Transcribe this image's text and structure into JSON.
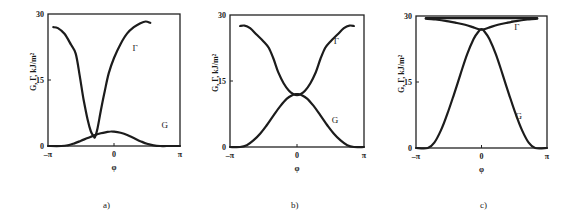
{
  "figure": {
    "panels": [
      "a)",
      "b)",
      "c)"
    ]
  },
  "chart_data": [
    {
      "type": "line",
      "panel": "a)",
      "xlabel": "φ",
      "ylabel": "G, Γ, kJ/m²",
      "xlim": [
        -3.1416,
        3.1416
      ],
      "ylim": [
        0,
        30
      ],
      "xticks": [
        "-π",
        "0",
        "π"
      ],
      "yticks": [
        "0",
        "15",
        "30"
      ],
      "grid": false,
      "frame": {
        "x0": 48,
        "x1": 180,
        "y0": 14,
        "y1": 146
      },
      "series": [
        {
          "name": "Γ",
          "label_pos": [
            0.28,
            21.5
          ],
          "x_over_pi": [
            -0.92,
            -0.85,
            -0.75,
            -0.65,
            -0.58,
            -0.52,
            -0.46,
            -0.4,
            -0.35,
            -0.31,
            -0.29,
            -0.25,
            -0.2,
            -0.14,
            -0.08,
            0.0,
            0.1,
            0.2,
            0.3,
            0.4,
            0.48,
            0.55
          ],
          "values": [
            27.0,
            26.8,
            25.5,
            23.0,
            21.0,
            16.0,
            10.5,
            6.0,
            3.3,
            2.3,
            2.0,
            4.0,
            8.0,
            12.5,
            16.5,
            20.0,
            23.2,
            25.6,
            27.0,
            27.9,
            28.3,
            28.0
          ]
        },
        {
          "name": "G",
          "label_pos": [
            0.72,
            4.0
          ],
          "x_over_pi": [
            -1.0,
            -0.8,
            -0.7,
            -0.6,
            -0.5,
            -0.4,
            -0.3,
            -0.2,
            -0.1,
            -0.05,
            0.0,
            0.1,
            0.2,
            0.3,
            0.4,
            0.5,
            0.6,
            0.7,
            0.8,
            1.0
          ],
          "values": [
            0.0,
            0.0,
            0.15,
            0.6,
            1.2,
            1.8,
            2.4,
            2.9,
            3.2,
            3.3,
            3.25,
            3.0,
            2.5,
            1.8,
            1.1,
            0.5,
            0.15,
            0.0,
            0.0,
            0.0
          ]
        }
      ]
    },
    {
      "type": "line",
      "panel": "b)",
      "xlabel": "φ",
      "ylabel": "G, Γ, kJ/m²",
      "xlim": [
        -3.1416,
        3.1416
      ],
      "ylim": [
        0,
        30
      ],
      "xticks": [
        "-π",
        "0",
        "π"
      ],
      "yticks": [
        "0",
        "15",
        "30"
      ],
      "grid": false,
      "frame": {
        "x0": 230,
        "x1": 364,
        "y0": 15,
        "y1": 147
      },
      "series": [
        {
          "name": "Γ",
          "label_pos": [
            0.55,
            23.5
          ],
          "x_over_pi": [
            -0.85,
            -0.78,
            -0.7,
            -0.6,
            -0.5,
            -0.42,
            -0.35,
            -0.28,
            -0.2,
            -0.12,
            -0.05,
            0.0,
            0.05,
            0.12,
            0.2,
            0.28,
            0.35,
            0.42,
            0.5,
            0.6,
            0.7,
            0.78,
            0.85
          ],
          "values": [
            27.5,
            27.6,
            27.0,
            25.5,
            24.0,
            22.5,
            20.0,
            17.0,
            14.5,
            12.8,
            12.0,
            11.8,
            12.0,
            12.8,
            14.5,
            17.0,
            20.0,
            22.5,
            24.0,
            25.5,
            27.0,
            27.6,
            27.5
          ]
        },
        {
          "name": "G",
          "label_pos": [
            0.52,
            5.5
          ],
          "x_over_pi": [
            -1.0,
            -0.85,
            -0.75,
            -0.65,
            -0.55,
            -0.45,
            -0.35,
            -0.25,
            -0.15,
            -0.05,
            0.0,
            0.05,
            0.15,
            0.25,
            0.35,
            0.45,
            0.55,
            0.65,
            0.75,
            0.85,
            1.0
          ],
          "values": [
            0.0,
            0.0,
            0.4,
            1.5,
            3.0,
            5.0,
            7.2,
            9.3,
            11.0,
            11.9,
            12.0,
            11.9,
            11.0,
            9.3,
            7.2,
            5.0,
            3.0,
            1.5,
            0.4,
            0.0,
            0.0
          ]
        }
      ]
    },
    {
      "type": "line",
      "panel": "c)",
      "xlabel": "φ",
      "ylabel": "G, Γ, kJ/m²",
      "xlim": [
        -3.1416,
        3.1416
      ],
      "ylim": [
        0,
        30
      ],
      "xticks": [
        "-π",
        "0",
        "π"
      ],
      "yticks": [
        "0",
        "15",
        "30"
      ],
      "grid": false,
      "frame": {
        "x0": 416,
        "x1": 547,
        "y0": 16,
        "y1": 148
      },
      "series": [
        {
          "name": "Γ",
          "label_pos": [
            0.5,
            26.8
          ],
          "x_over_pi": [
            -0.85,
            -0.7,
            -0.55,
            -0.4,
            -0.25,
            -0.12,
            -0.04,
            0.0,
            0.04,
            0.12,
            0.25,
            0.4,
            0.55,
            0.7,
            0.85
          ],
          "values": [
            29.4,
            29.2,
            28.9,
            28.5,
            28.0,
            27.4,
            27.0,
            26.9,
            27.0,
            27.4,
            28.0,
            28.5,
            28.9,
            29.2,
            29.4
          ]
        },
        {
          "name": "Γ-upper",
          "x_over_pi": [
            -0.85,
            0.85
          ],
          "values": [
            29.5,
            29.5
          ]
        },
        {
          "name": "G",
          "label_pos": [
            0.52,
            6.5
          ],
          "x_over_pi": [
            -1.0,
            -0.82,
            -0.72,
            -0.62,
            -0.52,
            -0.42,
            -0.32,
            -0.22,
            -0.12,
            -0.04,
            0.0,
            0.04,
            0.12,
            0.22,
            0.32,
            0.42,
            0.52,
            0.62,
            0.72,
            0.82,
            1.0
          ],
          "values": [
            0.0,
            0.0,
            1.2,
            4.0,
            7.8,
            12.2,
            16.8,
            21.3,
            24.8,
            26.6,
            27.0,
            26.6,
            24.8,
            21.3,
            16.8,
            12.2,
            7.8,
            4.0,
            1.2,
            0.0,
            0.0
          ]
        }
      ]
    }
  ]
}
